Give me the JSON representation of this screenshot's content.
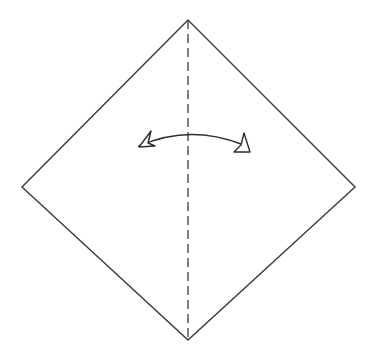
{
  "figure": {
    "kind": "origami-fold-diagram",
    "title": "",
    "caption": "",
    "width": 384,
    "height": 354,
    "background_color": "#ffffff"
  },
  "colors": {
    "paper_fill": "#ffffff",
    "paper_edge": "#3a3a3a",
    "fold_line": "#4a4a4a",
    "arrow_stroke": "#2e2e2e",
    "arrow_fill": "#ffffff"
  },
  "shapes": {
    "paper": {
      "name": "square-sheet-rotated-45",
      "label": "square paper diamond",
      "points": "188,20 355,187 188,340 22,187",
      "stroke_width": 1.4,
      "closed": true
    },
    "fold_line": {
      "name": "vertical-valley-fold-line",
      "label": "center fold line",
      "line_style": "dash-dot",
      "x": 188,
      "y1": 20,
      "y2": 340,
      "stroke_width": 1.4,
      "dash_pattern": "9 5"
    },
    "arc_arrow": {
      "name": "fold-in-half-arrow",
      "label": "fold in half arrow",
      "direction": "double-headed",
      "path": "M 139,146 Q 189,124 241,144",
      "stroke_width": 1.6,
      "arrowhead_style": "hollow-triangle",
      "left_head": {
        "points": "139,147 151,131 148,143 155,146",
        "label": "left arrowhead"
      },
      "right_head": {
        "points": "241,145 234,152 250,152 244,133",
        "label": "right arrowhead"
      }
    }
  },
  "annotations": []
}
